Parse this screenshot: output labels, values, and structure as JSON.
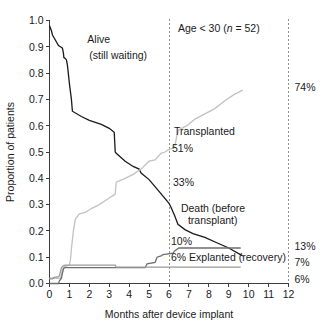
{
  "chart_data": {
    "type": "line",
    "title": "",
    "annotation_header": "Age < 30 (n = 52)",
    "annotation_header_plain": "Age < 30 (",
    "annotation_header_italic": "n",
    "annotation_header_tail": " = 52)",
    "xlabel": "Months after device implant",
    "ylabel": "Proportion of patients",
    "xlim": [
      0,
      12
    ],
    "ylim": [
      0.0,
      1.0
    ],
    "grid": false,
    "legend_position": "inline-annotations",
    "xticks": [
      "0",
      "1",
      "2",
      "3",
      "4",
      "5",
      "6",
      "7",
      "8",
      "9",
      "10",
      "11",
      "12"
    ],
    "xtick_values": [
      0,
      1,
      2,
      3,
      4,
      5,
      6,
      7,
      8,
      9,
      10,
      11,
      12
    ],
    "yticks": [
      "0.0",
      "0.1",
      "0.2",
      "0.3",
      "0.4",
      "0.5",
      "0.6",
      "0.7",
      "0.8",
      "0.9",
      "1.0"
    ],
    "ytick_values": [
      0.0,
      0.1,
      0.2,
      0.3,
      0.4,
      0.5,
      0.6,
      0.7,
      0.8,
      0.9,
      1.0
    ],
    "reference_lines": [
      {
        "name": "month-6-marker",
        "x": 6,
        "style": "dashed"
      },
      {
        "name": "month-12-marker",
        "x": 12,
        "style": "dashed"
      }
    ],
    "series": [
      {
        "name": "Alive (still waiting)",
        "color": "#1a1a1a",
        "label": "Alive\n(still waiting)",
        "x": [
          0.0,
          0.1,
          0.15,
          0.3,
          0.45,
          0.55,
          0.65,
          0.7,
          0.72,
          0.8,
          0.85,
          0.9,
          1.0,
          1.1,
          1.15,
          1.6,
          2.0,
          2.6,
          3.0,
          3.25,
          3.3,
          3.35,
          3.8,
          4.2,
          4.5,
          4.6,
          5.0,
          5.5,
          6.0,
          6.1,
          6.3,
          6.4,
          6.45,
          6.8,
          7.2,
          7.8,
          8.4,
          9.0,
          9.7
        ],
        "y": [
          0.98,
          0.96,
          0.945,
          0.925,
          0.905,
          0.9,
          0.895,
          0.875,
          0.86,
          0.855,
          0.85,
          0.83,
          0.76,
          0.7,
          0.655,
          0.635,
          0.62,
          0.605,
          0.59,
          0.575,
          0.5,
          0.495,
          0.465,
          0.445,
          0.435,
          0.42,
          0.395,
          0.35,
          0.305,
          0.29,
          0.255,
          0.235,
          0.225,
          0.205,
          0.19,
          0.175,
          0.155,
          0.135,
          0.105
        ]
      },
      {
        "name": "Transplanted",
        "color": "#c2c2c2",
        "label": "Transplanted",
        "x": [
          0.0,
          0.55,
          0.6,
          0.65,
          0.7,
          0.8,
          0.9,
          1.0,
          1.05,
          1.1,
          1.2,
          1.3,
          1.5,
          1.8,
          2.1,
          2.5,
          3.0,
          3.2,
          3.3,
          3.35,
          3.8,
          4.2,
          4.6,
          5.0,
          5.3,
          5.6,
          5.8,
          6.0,
          6.1,
          6.2,
          6.3,
          6.4,
          6.5,
          6.9,
          7.3,
          7.8,
          8.3,
          8.8,
          9.3,
          9.7
        ],
        "y": [
          0.02,
          0.02,
          0.035,
          0.05,
          0.06,
          0.065,
          0.068,
          0.07,
          0.09,
          0.13,
          0.2,
          0.245,
          0.265,
          0.27,
          0.285,
          0.3,
          0.325,
          0.335,
          0.34,
          0.385,
          0.4,
          0.415,
          0.435,
          0.465,
          0.47,
          0.495,
          0.5,
          0.51,
          0.512,
          0.515,
          0.525,
          0.565,
          0.585,
          0.6,
          0.625,
          0.645,
          0.665,
          0.695,
          0.72,
          0.735
        ]
      },
      {
        "name": "Death (before transplant)",
        "color": "#6e6e6e",
        "label": "Death (before\ntransplant)",
        "x": [
          0.0,
          0.45,
          0.5,
          0.6,
          0.65,
          0.7,
          0.75,
          4.8,
          4.9,
          5.3,
          5.4,
          5.6,
          5.7,
          6.2,
          6.3,
          6.4,
          6.5,
          9.6
        ],
        "y": [
          0.0,
          0.0,
          0.01,
          0.02,
          0.04,
          0.055,
          0.06,
          0.06,
          0.075,
          0.08,
          0.1,
          0.105,
          0.11,
          0.115,
          0.125,
          0.13,
          0.135,
          0.135
        ]
      },
      {
        "name": "Explanted (recovery)",
        "color": "#9a9a9a",
        "label": "6% Explanted (recovery)",
        "x": [
          0.0,
          0.15,
          0.2,
          0.45,
          0.5,
          0.55,
          0.6,
          0.7,
          0.8,
          3.3,
          3.35,
          9.6
        ],
        "y": [
          0.018,
          0.018,
          0.022,
          0.026,
          0.03,
          0.045,
          0.06,
          0.068,
          0.07,
          0.07,
          0.062,
          0.062
        ]
      }
    ],
    "inline_annotations": [
      {
        "name": "alive-label-line1",
        "text": "Alive",
        "color": "#1a1a1a",
        "x": 1.9,
        "y": 0.915
      },
      {
        "name": "alive-label-line2",
        "text": "(still waiting)",
        "color": "#1a1a1a",
        "x": 2.0,
        "y": 0.855
      },
      {
        "name": "transplanted-label",
        "text": "Transplanted",
        "color": "#c2c2c2",
        "x": 6.25,
        "y": 0.565
      },
      {
        "name": "transplanted-pct-51",
        "text": "51%",
        "color": "#c2c2c2",
        "x": 6.15,
        "y": 0.5
      },
      {
        "name": "alive-pct-33",
        "text": "33%",
        "color": "#1a1a1a",
        "x": 6.2,
        "y": 0.37
      },
      {
        "name": "death-label-line1",
        "text": "Death (before",
        "color": "#4a4a4a",
        "x": 6.6,
        "y": 0.27
      },
      {
        "name": "death-label-line2",
        "text": "transplant)",
        "color": "#4a4a4a",
        "x": 6.95,
        "y": 0.225
      },
      {
        "name": "death-pct-10",
        "text": "10%",
        "color": "#1a1a1a",
        "x": 6.1,
        "y": 0.148
      },
      {
        "name": "explanted-label",
        "text": "6% Explanted (recovery)",
        "color": "#8a8a8a",
        "x": 6.1,
        "y": 0.085
      }
    ],
    "right_edge_labels": [
      {
        "name": "right-pct-74",
        "text": "74%",
        "color": "#d2d2d2",
        "y": 0.745
      },
      {
        "name": "right-pct-13",
        "text": "13%",
        "color": "#5a5a5a",
        "y": 0.142
      },
      {
        "name": "right-pct-7",
        "text": "7%",
        "color": "#2a2a2a",
        "y": 0.082
      },
      {
        "name": "right-pct-6",
        "text": "6%",
        "color": "#5a5a5a",
        "y": 0.018
      }
    ]
  }
}
